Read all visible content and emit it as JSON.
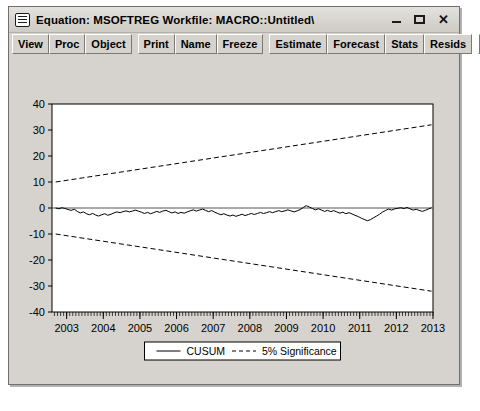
{
  "window": {
    "title": "Equation: MSOFTREG   Workfile: MACRO::Untitled\\",
    "sysmenu_icon": "window-menu-icon",
    "controls": {
      "minimize": "minimize-icon",
      "maximize": "maximize-icon",
      "close": "✕"
    }
  },
  "toolbar": {
    "group1": [
      "View",
      "Proc",
      "Object"
    ],
    "group2": [
      "Print",
      "Name",
      "Freeze"
    ],
    "group3": [
      "Estimate",
      "Forecast",
      "Stats",
      "Resids"
    ]
  },
  "chart_data": {
    "type": "line",
    "title": "",
    "xlabel": "",
    "ylabel": "",
    "xlim": [
      2002.6,
      2013.0
    ],
    "ylim": [
      -40,
      40
    ],
    "grid": false,
    "legend_position": "bottom-center",
    "yticks": [
      40,
      30,
      20,
      10,
      0,
      -10,
      -20,
      -30,
      -40
    ],
    "xticks": [
      2003,
      2004,
      2005,
      2006,
      2007,
      2008,
      2009,
      2010,
      2011,
      2012,
      2013
    ],
    "minor_tick_interval_months": 1,
    "series": [
      {
        "name": "CUSUM",
        "style": "solid",
        "color": "#000000",
        "x": [
          2002.7,
          2002.79,
          2002.87,
          2002.96,
          2003.04,
          2003.12,
          2003.21,
          2003.29,
          2003.37,
          2003.46,
          2003.54,
          2003.62,
          2003.71,
          2003.79,
          2003.87,
          2003.96,
          2004.04,
          2004.12,
          2004.21,
          2004.29,
          2004.37,
          2004.46,
          2004.54,
          2004.62,
          2004.71,
          2004.79,
          2004.87,
          2004.96,
          2005.04,
          2005.12,
          2005.21,
          2005.29,
          2005.37,
          2005.46,
          2005.54,
          2005.62,
          2005.71,
          2005.79,
          2005.87,
          2005.96,
          2006.04,
          2006.12,
          2006.21,
          2006.29,
          2006.37,
          2006.46,
          2006.54,
          2006.62,
          2006.71,
          2006.79,
          2006.87,
          2006.96,
          2007.04,
          2007.12,
          2007.21,
          2007.29,
          2007.37,
          2007.46,
          2007.54,
          2007.62,
          2007.71,
          2007.79,
          2007.87,
          2007.96,
          2008.04,
          2008.12,
          2008.21,
          2008.29,
          2008.37,
          2008.46,
          2008.54,
          2008.62,
          2008.71,
          2008.79,
          2008.87,
          2008.96,
          2009.04,
          2009.12,
          2009.21,
          2009.29,
          2009.37,
          2009.46,
          2009.54,
          2009.62,
          2009.71,
          2009.79,
          2009.87,
          2009.96,
          2010.04,
          2010.12,
          2010.21,
          2010.29,
          2010.37,
          2010.46,
          2010.54,
          2010.62,
          2010.71,
          2010.79,
          2010.87,
          2010.96,
          2011.04,
          2011.12,
          2011.21,
          2011.29,
          2011.37,
          2011.46,
          2011.54,
          2011.62,
          2011.71,
          2011.79,
          2011.87,
          2011.96,
          2012.04,
          2012.12,
          2012.21,
          2012.29,
          2012.37,
          2012.46,
          2012.54,
          2012.62,
          2012.71,
          2012.79,
          2012.87,
          2012.96
        ],
        "y": [
          0.0,
          -0.3,
          0.1,
          -0.2,
          -0.6,
          -0.9,
          -0.5,
          -1.3,
          -1.9,
          -1.5,
          -2.2,
          -2.6,
          -2.1,
          -2.7,
          -3.1,
          -2.6,
          -2.2,
          -2.8,
          -2.4,
          -1.9,
          -1.5,
          -1.8,
          -1.4,
          -1.1,
          -1.5,
          -1.2,
          -0.8,
          -1.2,
          -1.6,
          -2.1,
          -1.7,
          -2.2,
          -1.8,
          -1.3,
          -1.7,
          -1.2,
          -0.9,
          -1.4,
          -1.9,
          -1.5,
          -2.1,
          -1.7,
          -2.0,
          -1.5,
          -1.1,
          -0.7,
          -1.2,
          -0.8,
          -0.4,
          -0.9,
          -1.4,
          -1.0,
          -1.6,
          -2.1,
          -2.6,
          -2.2,
          -2.7,
          -3.1,
          -2.7,
          -3.2,
          -2.8,
          -2.4,
          -2.9,
          -2.5,
          -2.1,
          -2.5,
          -2.1,
          -1.7,
          -2.1,
          -1.8,
          -1.4,
          -1.8,
          -1.4,
          -1.0,
          -1.4,
          -1.1,
          -0.7,
          -1.1,
          -1.5,
          -1.1,
          -0.6,
          0.2,
          0.9,
          0.4,
          -0.2,
          -0.7,
          -0.3,
          -0.8,
          -1.3,
          -0.9,
          -1.4,
          -1.0,
          -1.5,
          -2.0,
          -1.6,
          -2.2,
          -1.8,
          -2.3,
          -2.8,
          -3.3,
          -3.9,
          -4.4,
          -4.9,
          -4.5,
          -3.8,
          -3.1,
          -2.4,
          -1.6,
          -0.9,
          -0.4,
          -0.8,
          -0.3,
          -0.1,
          0.1,
          -0.2,
          0.2,
          -0.3,
          -0.8,
          -0.5,
          -0.9,
          -1.3,
          -0.9,
          -0.4,
          0.1
        ]
      },
      {
        "name": "5% Significance",
        "style": "dashed",
        "color": "#000000",
        "upper": {
          "x": [
            2002.7,
            2012.96
          ],
          "y": [
            10.0,
            32.0
          ]
        },
        "lower": {
          "x": [
            2002.7,
            2012.96
          ],
          "y": [
            -10.0,
            -32.0
          ]
        }
      }
    ],
    "legend": [
      {
        "label": "CUSUM",
        "style": "solid"
      },
      {
        "label": "5% Significance",
        "style": "dashed"
      }
    ]
  }
}
